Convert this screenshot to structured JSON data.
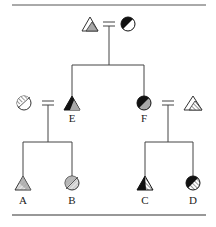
{
  "diagram": {
    "type": "pedigree",
    "colors": {
      "line": "#3a3a3a",
      "dark": "#111111",
      "gray": "#a8a8a8",
      "light": "#d8d8d8",
      "white": "#ffffff"
    },
    "individuals": [
      {
        "id": "P1",
        "label": "",
        "shape": "triangle",
        "fill": "white-with-gray-corner",
        "icon": "triangle-partial-gray-icon"
      },
      {
        "id": "P2",
        "label": "",
        "shape": "circle",
        "fill": "half-black-diagonal",
        "icon": "circle-half-black-icon"
      },
      {
        "id": "S1",
        "label": "",
        "shape": "circle",
        "fill": "hatched-partial",
        "icon": "circle-hatched-icon"
      },
      {
        "id": "E",
        "label": "E",
        "shape": "triangle",
        "fill": "black-and-gray",
        "icon": "triangle-black-gray-icon"
      },
      {
        "id": "F",
        "label": "F",
        "shape": "circle",
        "fill": "black-and-gray",
        "icon": "circle-black-gray-icon"
      },
      {
        "id": "S2",
        "label": "",
        "shape": "triangle",
        "fill": "white-with-hatched-corner",
        "icon": "triangle-hatched-corner-icon"
      },
      {
        "id": "A",
        "label": "A",
        "shape": "triangle",
        "fill": "gray-hatched",
        "icon": "triangle-gray-hatched-icon"
      },
      {
        "id": "B",
        "label": "B",
        "shape": "circle",
        "fill": "gray-hatched",
        "icon": "circle-gray-hatched-icon"
      },
      {
        "id": "C",
        "label": "C",
        "shape": "triangle",
        "fill": "black-and-hatched",
        "icon": "triangle-black-hatched-icon"
      },
      {
        "id": "D",
        "label": "D",
        "shape": "circle",
        "fill": "black-and-hatched",
        "icon": "circle-black-hatched-icon"
      }
    ],
    "unions": [
      {
        "partners": [
          "P1",
          "P2"
        ],
        "children": [
          "E",
          "F"
        ]
      },
      {
        "partners": [
          "S1",
          "E"
        ],
        "children": [
          "A",
          "B"
        ]
      },
      {
        "partners": [
          "F",
          "S2"
        ],
        "children": [
          "C",
          "D"
        ]
      }
    ],
    "labels": {
      "A": "A",
      "B": "B",
      "C": "C",
      "D": "D",
      "E": "E",
      "F": "F"
    }
  }
}
